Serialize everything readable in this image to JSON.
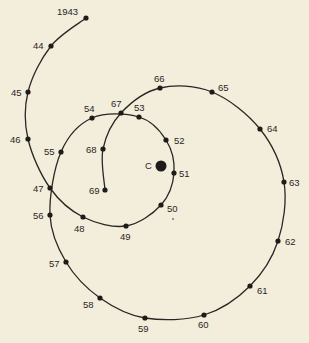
{
  "diagram": {
    "type": "spiral-timeline",
    "center": {
      "label": "C",
      "x": 161,
      "y": 166
    },
    "points": [
      {
        "label": "1943",
        "x": 86,
        "y": 18,
        "lx": 57,
        "ly": 15,
        "anchor": "start"
      },
      {
        "label": "44",
        "x": 51,
        "y": 46,
        "lx": 33,
        "ly": 49,
        "anchor": "start"
      },
      {
        "label": "45",
        "x": 28,
        "y": 92,
        "lx": 11,
        "ly": 96,
        "anchor": "start"
      },
      {
        "label": "46",
        "x": 28,
        "y": 139,
        "lx": 10,
        "ly": 143,
        "anchor": "start"
      },
      {
        "label": "47",
        "x": 50,
        "y": 188,
        "lx": 33,
        "ly": 192,
        "anchor": "start"
      },
      {
        "label": "48",
        "x": 83,
        "y": 217,
        "lx": 74,
        "ly": 232,
        "anchor": "start"
      },
      {
        "label": "49",
        "x": 126,
        "y": 226,
        "lx": 120,
        "ly": 240,
        "anchor": "start"
      },
      {
        "label": "50",
        "x": 161,
        "y": 205,
        "lx": 167,
        "ly": 212,
        "anchor": "start"
      },
      {
        "label": "51",
        "x": 174,
        "y": 173,
        "lx": 179,
        "ly": 177,
        "anchor": "start"
      },
      {
        "label": "52",
        "x": 166,
        "y": 140,
        "lx": 174,
        "ly": 144,
        "anchor": "start"
      },
      {
        "label": "53",
        "x": 139,
        "y": 117,
        "lx": 134,
        "ly": 111,
        "anchor": "start"
      },
      {
        "label": "54",
        "x": 92,
        "y": 118,
        "lx": 84,
        "ly": 112,
        "anchor": "start"
      },
      {
        "label": "55",
        "x": 61,
        "y": 152,
        "lx": 44,
        "ly": 155,
        "anchor": "start"
      },
      {
        "label": "56",
        "x": 50,
        "y": 215,
        "lx": 33,
        "ly": 219,
        "anchor": "start"
      },
      {
        "label": "57",
        "x": 66,
        "y": 262,
        "lx": 49,
        "ly": 267,
        "anchor": "start"
      },
      {
        "label": "58",
        "x": 100,
        "y": 298,
        "lx": 83,
        "ly": 308,
        "anchor": "start"
      },
      {
        "label": "59",
        "x": 145,
        "y": 318,
        "lx": 138,
        "ly": 332,
        "anchor": "start"
      },
      {
        "label": "60",
        "x": 204,
        "y": 315,
        "lx": 198,
        "ly": 328,
        "anchor": "start"
      },
      {
        "label": "61",
        "x": 250,
        "y": 286,
        "lx": 257,
        "ly": 294,
        "anchor": "start"
      },
      {
        "label": "62",
        "x": 278,
        "y": 241,
        "lx": 285,
        "ly": 245,
        "anchor": "start"
      },
      {
        "label": "63",
        "x": 284,
        "y": 182,
        "lx": 289,
        "ly": 186,
        "anchor": "start"
      },
      {
        "label": "64",
        "x": 260,
        "y": 129,
        "lx": 267,
        "ly": 132,
        "anchor": "start"
      },
      {
        "label": "65",
        "x": 212,
        "y": 92,
        "lx": 218,
        "ly": 91,
        "anchor": "start"
      },
      {
        "label": "66",
        "x": 160,
        "y": 88,
        "lx": 154,
        "ly": 82,
        "anchor": "start"
      },
      {
        "label": "67",
        "x": 121,
        "y": 113,
        "lx": 111,
        "ly": 107,
        "anchor": "start"
      },
      {
        "label": "68",
        "x": 103,
        "y": 149,
        "lx": 86,
        "ly": 153,
        "anchor": "start"
      },
      {
        "label": "69",
        "x": 105,
        "y": 190,
        "lx": 89,
        "ly": 194,
        "anchor": "start"
      }
    ],
    "colors": {
      "background": "#f3eddc",
      "ink": "#2a2623"
    }
  }
}
